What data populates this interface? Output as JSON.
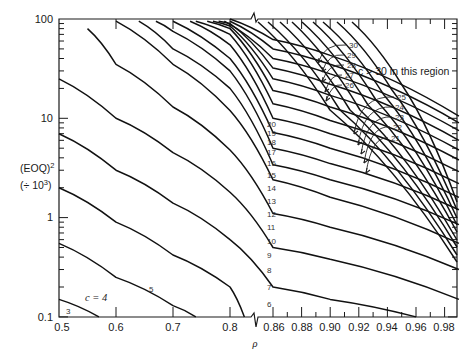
{
  "chart_data": {
    "type": "line",
    "title": "",
    "xlabel": "ρ",
    "ylabel_line1": "(EOQ)²",
    "ylabel_line2": "(÷ 10³)",
    "yscale": "log",
    "ylim": [
      0.1,
      100
    ],
    "xlim": [
      0.5,
      0.99
    ],
    "x_axis_break": "between 0.8 and 0.86 (scale changes)",
    "x_ticks_left": [
      "0.5",
      "0.6",
      "0.7",
      "0.8"
    ],
    "x_ticks_right": [
      "0.86",
      "0.88",
      "0.90",
      "0.92",
      "0.94",
      "0.96",
      "0.98"
    ],
    "y_ticks": [
      "0.1",
      "1",
      "10",
      "100"
    ],
    "grid": false,
    "annotations": [
      {
        "text": "c = 4",
        "near": "lower-left"
      },
      {
        "text": "c > 30 in this region",
        "near": "upper-right"
      }
    ],
    "series_labels": [
      "3",
      "5",
      "6",
      "7",
      "8",
      "9",
      "10",
      "11",
      "12",
      "13",
      "14",
      "15",
      "16",
      "17",
      "18",
      "19",
      "20",
      "21",
      "22",
      "23",
      "24",
      "25",
      "26",
      "27",
      "28",
      "29",
      "30"
    ],
    "series": [
      {
        "name": "c=3",
        "x": [
          0.5,
          0.57
        ],
        "values": [
          0.15,
          0.1
        ]
      },
      {
        "name": "c=4",
        "x": [
          0.5,
          0.6,
          0.7,
          0.74
        ],
        "values": [
          0.55,
          0.25,
          0.13,
          0.1
        ]
      },
      {
        "name": "c=5",
        "x": [
          0.5,
          0.6,
          0.7,
          0.8,
          0.84
        ],
        "values": [
          2.0,
          0.9,
          0.42,
          0.2,
          0.1
        ]
      },
      {
        "name": "c=6",
        "x": [
          0.5,
          0.6,
          0.7,
          0.8,
          0.86,
          0.9,
          0.96
        ],
        "values": [
          7.0,
          3.0,
          1.4,
          0.6,
          0.2,
          0.15,
          0.1
        ]
      },
      {
        "name": "c=7",
        "x": [
          0.5,
          0.6,
          0.7,
          0.8,
          0.86,
          0.9,
          0.99
        ],
        "values": [
          25,
          10,
          4.5,
          1.8,
          0.5,
          0.38,
          0.15
        ]
      },
      {
        "name": "c=8",
        "x": [
          0.55,
          0.6,
          0.7,
          0.8,
          0.86,
          0.9,
          0.99
        ],
        "values": [
          80,
          35,
          13,
          4.8,
          1.1,
          0.8,
          0.3
        ]
      },
      {
        "name": "c=9",
        "x": [
          0.6,
          0.7,
          0.8,
          0.86,
          0.9,
          0.99
        ],
        "values": [
          95,
          35,
          12,
          2.4,
          1.6,
          0.55
        ]
      },
      {
        "name": "c=10",
        "x": [
          0.64,
          0.7,
          0.8,
          0.86,
          0.9,
          0.99
        ],
        "values": [
          95,
          50,
          20,
          3.4,
          2.4,
          0.85
        ]
      },
      {
        "name": "c=11",
        "x": [
          0.67,
          0.7,
          0.8,
          0.86,
          0.9,
          0.99
        ],
        "values": [
          95,
          75,
          30,
          5.0,
          3.5,
          1.2
        ]
      },
      {
        "name": "c=12",
        "x": [
          0.7,
          0.8,
          0.86,
          0.9,
          0.99
        ],
        "values": [
          95,
          40,
          7.2,
          5.0,
          1.6
        ]
      },
      {
        "name": "c=13",
        "x": [
          0.73,
          0.8,
          0.86,
          0.9,
          0.99
        ],
        "values": [
          95,
          55,
          10,
          7.0,
          2.2
        ]
      },
      {
        "name": "c=14",
        "x": [
          0.74,
          0.8,
          0.86,
          0.9,
          0.99
        ],
        "values": [
          95,
          70,
          14,
          9.5,
          2.9
        ]
      },
      {
        "name": "c=15",
        "x": [
          0.76,
          0.8,
          0.86,
          0.9,
          0.99
        ],
        "values": [
          95,
          80,
          19,
          13,
          3.8
        ]
      },
      {
        "name": "c=16",
        "x": [
          0.77,
          0.8,
          0.86,
          0.9,
          0.99
        ],
        "values": [
          95,
          85,
          25,
          17,
          4.8
        ]
      },
      {
        "name": "c=17",
        "x": [
          0.78,
          0.8,
          0.86,
          0.9,
          0.99
        ],
        "values": [
          95,
          90,
          32,
          22,
          6.0
        ]
      },
      {
        "name": "c=18",
        "x": [
          0.79,
          0.86,
          0.9,
          0.99
        ],
        "values": [
          95,
          40,
          28,
          7.5
        ]
      },
      {
        "name": "c=19",
        "x": [
          0.8,
          0.86,
          0.9,
          0.99
        ],
        "values": [
          95,
          50,
          35,
          9.0
        ]
      },
      {
        "name": "c=20",
        "x": [
          0.8,
          0.86,
          0.9,
          0.99
        ],
        "values": [
          100,
          62,
          43,
          10.5
        ]
      }
    ]
  },
  "labels": {
    "y_title_1": "(EOQ)",
    "y_title_1_sup": "2",
    "y_title_2": "(÷ 10",
    "y_title_2_sup": "3",
    "y_title_2_end": ")",
    "x_title": "ρ",
    "c_eq_4": "c = 4",
    "region_note": "c > 30 in this region",
    "y_ticks": [
      "100",
      "10",
      "1",
      "0.1"
    ],
    "x_ticks": [
      "0.5",
      "0.6",
      "0.7",
      "0.8",
      "0.86",
      "0.88",
      "0.90",
      "0.92",
      "0.94",
      "0.96",
      "0.98"
    ],
    "curve_labels_left": [
      "3",
      "5"
    ],
    "curve_labels_mid": [
      "6",
      "7",
      "8",
      "9",
      "10",
      "11",
      "12",
      "13",
      "14",
      "15",
      "16",
      "17",
      "18",
      "19",
      "20"
    ],
    "curve_labels_arrow": [
      "30",
      "29",
      "28",
      "27",
      "26",
      "25",
      "24",
      "23",
      "22",
      "21"
    ]
  }
}
